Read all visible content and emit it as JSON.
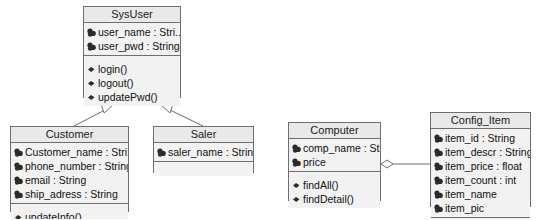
{
  "diagram": {
    "kind": "uml-class-diagram",
    "background_color": "#ffffff",
    "border_color": "#6e6e6e",
    "title_fill": "#e9e9e9",
    "compartment_fill": "#f2f2f2",
    "text_color": "#111111"
  },
  "classes": [
    {
      "id": "sysuser",
      "name": "SysUser",
      "x": 83,
      "y": 6,
      "width": 98,
      "height": 92,
      "attributes": [
        {
          "icon": "attribute-icon",
          "text": "user_name : Stri..."
        },
        {
          "icon": "attribute-icon",
          "text": "user_pwd : String"
        }
      ],
      "operations": [
        {
          "icon": "operation-icon",
          "text": "login()"
        },
        {
          "icon": "operation-icon",
          "text": "logout()"
        },
        {
          "icon": "operation-icon",
          "text": "updatePwd()"
        }
      ]
    },
    {
      "id": "customer",
      "name": "Customer",
      "x": 10,
      "y": 126,
      "width": 119,
      "height": 86,
      "attributes": [
        {
          "icon": "attribute-icon",
          "text": "Customer_name : Stri..."
        },
        {
          "icon": "attribute-icon",
          "text": "phone_number : String"
        },
        {
          "icon": "attribute-icon",
          "text": "email : String"
        },
        {
          "icon": "attribute-icon",
          "text": "ship_adress : String"
        }
      ],
      "operations": [
        {
          "icon": "operation-icon",
          "text": "updateInfo()"
        }
      ]
    },
    {
      "id": "saler",
      "name": "Saler",
      "x": 153,
      "y": 126,
      "width": 101,
      "height": 47,
      "attributes": [
        {
          "icon": "attribute-icon",
          "text": "saler_name : String"
        }
      ],
      "operations": []
    },
    {
      "id": "computer",
      "name": "Computer",
      "x": 288,
      "y": 122,
      "width": 93,
      "height": 79,
      "attributes": [
        {
          "icon": "attribute-icon",
          "text": "comp_name : String"
        },
        {
          "icon": "attribute-icon",
          "text": "price"
        }
      ],
      "operations": [
        {
          "icon": "operation-icon",
          "text": "findAll()"
        },
        {
          "icon": "operation-icon",
          "text": "findDetail()"
        }
      ]
    },
    {
      "id": "config_item",
      "name": "Config_Item",
      "x": 430,
      "y": 112,
      "width": 101,
      "height": 95,
      "attributes": [
        {
          "icon": "attribute-icon",
          "text": "item_id : String"
        },
        {
          "icon": "attribute-icon",
          "text": "item_descr : String"
        },
        {
          "icon": "attribute-icon",
          "text": "item_price : float"
        },
        {
          "icon": "attribute-icon",
          "text": "item_count : int"
        },
        {
          "icon": "attribute-icon",
          "text": "item_name"
        },
        {
          "icon": "attribute-icon",
          "text": "item_pic"
        }
      ],
      "operations": []
    }
  ],
  "relationships": [
    {
      "id": "customer-generalizes-sysuser",
      "type": "generalization",
      "from": "customer",
      "to": "sysuser",
      "marker": "hollow-triangle"
    },
    {
      "id": "saler-generalizes-sysuser",
      "type": "generalization",
      "from": "saler",
      "to": "sysuser",
      "marker": "hollow-triangle"
    },
    {
      "id": "computer-aggregates-config-item",
      "type": "aggregation",
      "from": "computer",
      "to": "config_item",
      "marker": "hollow-diamond"
    }
  ]
}
